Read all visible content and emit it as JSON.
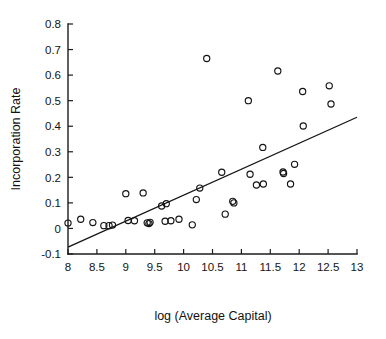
{
  "chart_data": {
    "type": "scatter",
    "title": "",
    "xlabel": "log (Average Capital)",
    "ylabel": "Incorporation Rate",
    "xlim": [
      8,
      13
    ],
    "ylim": [
      -0.1,
      0.8
    ],
    "grid": false,
    "legend": "none",
    "xticks": [
      8,
      8.5,
      9,
      9.5,
      10,
      10.5,
      11,
      11.5,
      12,
      12.5,
      13
    ],
    "xticklabels": [
      "8",
      "8.5",
      "9",
      "9.5",
      "10",
      "10.5",
      "11",
      "11.5",
      "12",
      "12.5",
      "13"
    ],
    "yticks": [
      -0.1,
      0,
      0.1,
      0.2,
      0.3,
      0.4,
      0.5,
      0.6,
      0.7,
      0.8
    ],
    "yticklabels": [
      "-0.1",
      "0",
      "0.1",
      "0.2",
      "0.3",
      "0.4",
      "0.5",
      "0.6",
      "0.7",
      "0.8"
    ],
    "marker": "open-circle",
    "marker_color": "#141414",
    "points": [
      {
        "x": 8.0,
        "y": 0.021
      },
      {
        "x": 8.22,
        "y": 0.036
      },
      {
        "x": 8.43,
        "y": 0.023
      },
      {
        "x": 8.62,
        "y": 0.011
      },
      {
        "x": 8.71,
        "y": 0.011
      },
      {
        "x": 8.77,
        "y": 0.013
      },
      {
        "x": 9.0,
        "y": 0.136
      },
      {
        "x": 9.04,
        "y": 0.031
      },
      {
        "x": 9.15,
        "y": 0.03
      },
      {
        "x": 9.3,
        "y": 0.139
      },
      {
        "x": 9.37,
        "y": 0.022
      },
      {
        "x": 9.4,
        "y": 0.019
      },
      {
        "x": 9.42,
        "y": 0.024
      },
      {
        "x": 9.62,
        "y": 0.088
      },
      {
        "x": 9.68,
        "y": 0.028
      },
      {
        "x": 9.7,
        "y": 0.097
      },
      {
        "x": 9.78,
        "y": 0.03
      },
      {
        "x": 9.92,
        "y": 0.036
      },
      {
        "x": 10.15,
        "y": 0.014
      },
      {
        "x": 10.22,
        "y": 0.113
      },
      {
        "x": 10.28,
        "y": 0.158
      },
      {
        "x": 10.4,
        "y": 0.665
      },
      {
        "x": 10.66,
        "y": 0.22
      },
      {
        "x": 10.72,
        "y": 0.056
      },
      {
        "x": 10.85,
        "y": 0.106
      },
      {
        "x": 10.87,
        "y": 0.1
      },
      {
        "x": 11.12,
        "y": 0.5
      },
      {
        "x": 11.15,
        "y": 0.212
      },
      {
        "x": 11.26,
        "y": 0.17
      },
      {
        "x": 11.37,
        "y": 0.317
      },
      {
        "x": 11.38,
        "y": 0.174
      },
      {
        "x": 11.63,
        "y": 0.616
      },
      {
        "x": 11.72,
        "y": 0.221
      },
      {
        "x": 11.73,
        "y": 0.215
      },
      {
        "x": 11.85,
        "y": 0.174
      },
      {
        "x": 11.92,
        "y": 0.251
      },
      {
        "x": 12.06,
        "y": 0.536
      },
      {
        "x": 12.07,
        "y": 0.401
      },
      {
        "x": 12.52,
        "y": 0.558
      },
      {
        "x": 12.55,
        "y": 0.487
      }
    ],
    "fit_line": {
      "type": "linear-regression",
      "x_start": 8.0,
      "y_start": -0.073,
      "x_end": 13.0,
      "y_end": 0.435
    }
  }
}
